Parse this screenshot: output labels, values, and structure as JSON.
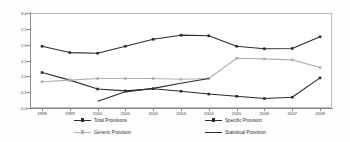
{
  "chart_data": {
    "type": "line",
    "title": "",
    "xlabel": "",
    "ylabel": "",
    "grid": false,
    "legend_position": "bottom",
    "ylim": [
      0.0,
      3.0
    ],
    "ytick_labels": [
      "0.0",
      "0.5",
      "1.0",
      "1.5",
      "2.0",
      "2.5",
      "3.0"
    ],
    "ytick_values": [
      0.0,
      0.5,
      1.0,
      1.5,
      2.0,
      2.5,
      3.0
    ],
    "categories": [
      "1998",
      "1999",
      "2000",
      "2001",
      "2002",
      "2003",
      "2004",
      "2005",
      "2006",
      "2007",
      "2008"
    ],
    "series": [
      {
        "name": "Total Provisions",
        "color": "#2b2b2b",
        "marker": "square",
        "values": [
          1.95,
          1.75,
          1.73,
          1.95,
          2.17,
          2.3,
          2.28,
          1.95,
          1.87,
          1.88,
          2.25
        ]
      },
      {
        "name": "Specific Provision",
        "color": "#2b2b2b",
        "marker": "square",
        "values": [
          1.12,
          0.88,
          0.6,
          0.54,
          0.61,
          0.53,
          0.44,
          0.37,
          0.3,
          0.34,
          0.95
        ]
      },
      {
        "name": "Generic Provision",
        "color": "#b0b0b0",
        "marker": "square",
        "values": [
          0.83,
          0.88,
          0.93,
          0.93,
          0.93,
          0.91,
          0.93,
          1.57,
          1.55,
          1.52,
          1.28
        ]
      },
      {
        "name": "Statistical Provision",
        "color": "#2b2b2b",
        "marker": "none",
        "values": [
          null,
          null,
          0.21,
          0.51,
          0.62,
          0.78,
          0.93,
          null,
          null,
          null,
          null
        ]
      }
    ]
  },
  "legend": {
    "total": "Total Provisions",
    "specific": "Specific Provision",
    "generic": "Generic Provision",
    "statistical": "Statistical Provision"
  },
  "axis": {
    "y": {
      "t0": "0.0",
      "t1": "0.5",
      "t2": "1.0",
      "t3": "1.5",
      "t4": "2.0",
      "t5": "2.5",
      "t6": "3.0"
    },
    "x": {
      "t0": "1998",
      "t1": "1999",
      "t2": "2000",
      "t3": "2001",
      "t4": "2002",
      "t5": "2003",
      "t6": "2004",
      "t7": "2005",
      "t8": "2006",
      "t9": "2007",
      "t10": "2008"
    }
  },
  "colors": {
    "dark_series": "#2b2b2b",
    "light_series": "#b0b0b0",
    "axis": "#8a8a8a",
    "frame": "#b9b9b9",
    "text": "#3c3c3c",
    "background": "#ffffff"
  }
}
